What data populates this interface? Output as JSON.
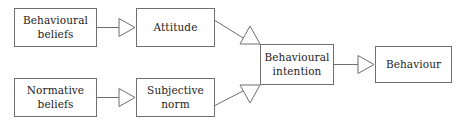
{
  "diagram": {
    "background_color": "#fefefe",
    "border_color": "#6f6f6f",
    "text_color": "#1d1d1d",
    "nodes": [
      {
        "id": "behavioural-beliefs",
        "label": "Behavioural\nbeliefs",
        "x": 14,
        "y": 8,
        "width": 83,
        "height": 39
      },
      {
        "id": "attitude",
        "label": "Attitude",
        "x": 136,
        "y": 8,
        "width": 79,
        "height": 39
      },
      {
        "id": "normative-beliefs",
        "label": "Normative\nbeliefs",
        "x": 14,
        "y": 78,
        "width": 83,
        "height": 39
      },
      {
        "id": "subjective-norm",
        "label": "Subjective\nnorm",
        "x": 136,
        "y": 78,
        "width": 79,
        "height": 39
      },
      {
        "id": "behavioural-intention",
        "label": "Behavioural\nintention",
        "x": 260,
        "y": 44,
        "width": 74,
        "height": 41
      },
      {
        "id": "behaviour",
        "label": "Behaviour",
        "x": 375,
        "y": 46,
        "width": 77,
        "height": 37
      }
    ],
    "edges": [
      {
        "id": "edge-behavioural-beliefs-to-attitude",
        "from": "behavioural-beliefs",
        "to": "attitude",
        "kind": "straight-horizontal"
      },
      {
        "id": "edge-normative-beliefs-to-subjective-norm",
        "from": "normative-beliefs",
        "to": "subjective-norm",
        "kind": "straight-horizontal"
      },
      {
        "id": "edge-attitude-to-behavioural-intention",
        "from": "attitude",
        "to": "behavioural-intention",
        "kind": "diagonal-down-right"
      },
      {
        "id": "edge-subjective-norm-to-behavioural-intention",
        "from": "subjective-norm",
        "to": "behavioural-intention",
        "kind": "diagonal-up-right"
      },
      {
        "id": "edge-behavioural-intention-to-behaviour",
        "from": "behavioural-intention",
        "to": "behaviour",
        "kind": "straight-horizontal"
      }
    ]
  }
}
